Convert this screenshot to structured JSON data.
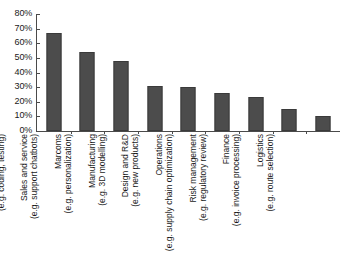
{
  "chart_data": {
    "type": "bar",
    "title": "",
    "subtitle": "",
    "xlabel": "",
    "ylabel": "",
    "ylim": [
      0,
      80
    ],
    "grid": false,
    "legend": "none",
    "orientation": "vertical",
    "bar_color": "#4c4c4c",
    "axis_color": "#4a4a4a",
    "value_suffix": "%",
    "ytick_labels": [
      "80%",
      "70%",
      "60%",
      "50%",
      "40%",
      "30%",
      "20%",
      "10%",
      "0%"
    ],
    "ytick_values": [
      80,
      70,
      60,
      50,
      40,
      30,
      20,
      10,
      0
    ],
    "categories": [
      "IT",
      "Sales and service",
      "Marcoms",
      "Manufacturing",
      "Design and R&D",
      "Operations",
      "Risk management",
      "Finance",
      "Logistics"
    ],
    "category_examples": [
      "(e.g. coding, testing)",
      "(e.g. support chatbots)",
      "(e.g. personalization)",
      "(e.g. 3D modelling)",
      "(e.g. new products)",
      "(e.g. supply chain optimization)",
      "(e.g. regulatory review)",
      "(e.g. invoice processing)",
      "(e.g. route selection)"
    ],
    "values": [
      67,
      54,
      48,
      31,
      30,
      26,
      23,
      15,
      10
    ]
  }
}
